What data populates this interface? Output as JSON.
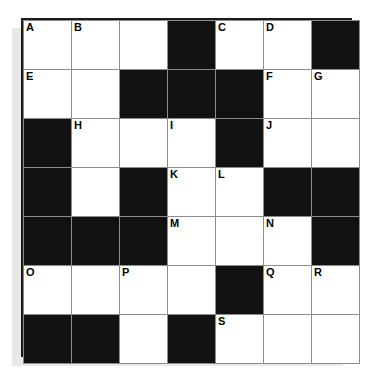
{
  "puzzle": {
    "title": "Crossword Grid",
    "rows": 7,
    "cols": 7,
    "colors": {
      "block": "#111111",
      "cell": "#ffffff",
      "grid_line": "#8c8c8c",
      "frame": "#1a1a1a",
      "shadow": "#e8e8e8",
      "label_text": "#000000",
      "page_background": "#ffffff"
    },
    "grid": [
      [
        {
          "type": "white",
          "label": "A"
        },
        {
          "type": "white",
          "label": "B"
        },
        {
          "type": "white",
          "label": ""
        },
        {
          "type": "black",
          "label": ""
        },
        {
          "type": "white",
          "label": "C"
        },
        {
          "type": "white",
          "label": "D"
        },
        {
          "type": "black",
          "label": ""
        }
      ],
      [
        {
          "type": "white",
          "label": "E"
        },
        {
          "type": "white",
          "label": ""
        },
        {
          "type": "black",
          "label": ""
        },
        {
          "type": "black",
          "label": ""
        },
        {
          "type": "black",
          "label": ""
        },
        {
          "type": "white",
          "label": "F"
        },
        {
          "type": "white",
          "label": "G"
        }
      ],
      [
        {
          "type": "black",
          "label": ""
        },
        {
          "type": "white",
          "label": "H"
        },
        {
          "type": "white",
          "label": ""
        },
        {
          "type": "white",
          "label": "I"
        },
        {
          "type": "black",
          "label": ""
        },
        {
          "type": "white",
          "label": "J"
        },
        {
          "type": "white",
          "label": ""
        }
      ],
      [
        {
          "type": "black",
          "label": ""
        },
        {
          "type": "white",
          "label": ""
        },
        {
          "type": "black",
          "label": ""
        },
        {
          "type": "white",
          "label": "K"
        },
        {
          "type": "white",
          "label": "L"
        },
        {
          "type": "black",
          "label": ""
        },
        {
          "type": "black",
          "label": ""
        }
      ],
      [
        {
          "type": "black",
          "label": ""
        },
        {
          "type": "black",
          "label": ""
        },
        {
          "type": "black",
          "label": ""
        },
        {
          "type": "white",
          "label": "M"
        },
        {
          "type": "white",
          "label": ""
        },
        {
          "type": "white",
          "label": "N"
        },
        {
          "type": "black",
          "label": ""
        }
      ],
      [
        {
          "type": "white",
          "label": "O"
        },
        {
          "type": "white",
          "label": ""
        },
        {
          "type": "white",
          "label": "P"
        },
        {
          "type": "white",
          "label": ""
        },
        {
          "type": "black",
          "label": ""
        },
        {
          "type": "white",
          "label": "Q"
        },
        {
          "type": "white",
          "label": "R"
        }
      ],
      [
        {
          "type": "black",
          "label": ""
        },
        {
          "type": "black",
          "label": ""
        },
        {
          "type": "white",
          "label": ""
        },
        {
          "type": "black",
          "label": ""
        },
        {
          "type": "white",
          "label": "S"
        },
        {
          "type": "white",
          "label": ""
        },
        {
          "type": "white",
          "label": ""
        }
      ]
    ],
    "labels_in_order": [
      "A",
      "B",
      "C",
      "D",
      "E",
      "F",
      "G",
      "H",
      "I",
      "J",
      "K",
      "L",
      "M",
      "N",
      "O",
      "P",
      "Q",
      "R",
      "S"
    ]
  }
}
